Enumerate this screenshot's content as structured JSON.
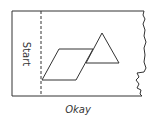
{
  "diagram": {
    "strip_label": "Start",
    "caption": "Okay",
    "shapes": [
      "parallelogram",
      "triangle"
    ],
    "colors": {
      "stroke": "#333333",
      "background": "#ffffff"
    }
  }
}
